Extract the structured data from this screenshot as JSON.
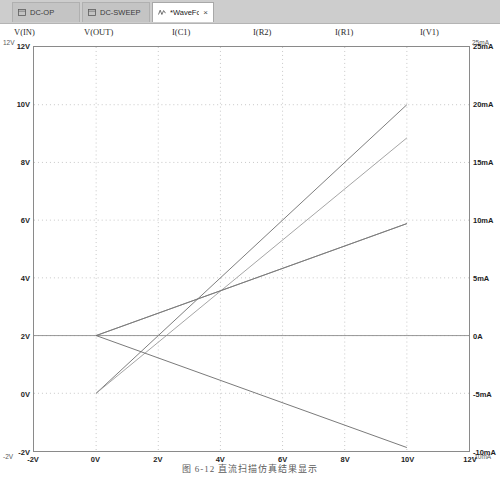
{
  "window": {
    "tabs": [
      {
        "id": "dc-op",
        "label": "DC-OP",
        "icon": "document-icon",
        "active": false,
        "closable": false
      },
      {
        "id": "dc-sweep",
        "label": "DC-SWEEP",
        "icon": "document-icon",
        "active": false,
        "closable": false
      },
      {
        "id": "waveform",
        "label": "*WaveForm",
        "icon": "waveform-icon",
        "active": true,
        "closable": true,
        "close_label": "×"
      }
    ]
  },
  "legend": {
    "items": [
      {
        "label": "V(IN)",
        "x": 14
      },
      {
        "label": "V(OUT)",
        "x": 84
      },
      {
        "label": "I(C1)",
        "x": 172
      },
      {
        "label": "I(R2)",
        "x": 253
      },
      {
        "label": "I(R1)",
        "x": 335
      },
      {
        "label": "I(V1)",
        "x": 420
      }
    ]
  },
  "corner_labels": {
    "top_left": "12V",
    "top_right": "25mA",
    "bottom_left": "-2V",
    "bottom_right": "-10mA"
  },
  "chart_data": {
    "type": "line",
    "title": "",
    "xlabel": "",
    "ylabel": "",
    "grid": true,
    "legend_position": "top",
    "x": [
      -2,
      0,
      2,
      4,
      6,
      8,
      10,
      12
    ],
    "xlim": [
      -2,
      12
    ],
    "xticks": [
      "-2V",
      "0V",
      "2V",
      "4V",
      "6V",
      "8V",
      "10V",
      "12V"
    ],
    "y_left": {
      "label": "V",
      "ylim": [
        -2,
        12
      ],
      "yticks": [
        "-2V",
        "0V",
        "2V",
        "4V",
        "6V",
        "8V",
        "10V",
        "12V"
      ]
    },
    "y_right": {
      "label": "A",
      "ylim": [
        -10,
        25
      ],
      "yticks": [
        "-10mA",
        "-5mA",
        "0A",
        "5mA",
        "10mA",
        "15mA",
        "20mA",
        "25mA"
      ]
    },
    "series": [
      {
        "name": "V(IN)",
        "axis": "left",
        "color": "#6f6f6f",
        "points": [
          [
            0,
            0
          ],
          [
            10,
            10
          ]
        ],
        "note": "ramp 0V to 10V"
      },
      {
        "name": "V(OUT)",
        "axis": "left",
        "color": "#9a9a9a",
        "points": [
          [
            0,
            0
          ],
          [
            10,
            8.85
          ]
        ],
        "note": "ramp 0V to about 8.85V"
      },
      {
        "name": "I(C1)",
        "axis": "right",
        "color": "#8c8c8c",
        "points": [
          [
            -2,
            0
          ],
          [
            12,
            0
          ]
        ],
        "note": "flat 0A across sweep"
      },
      {
        "name": "I(R2)",
        "axis": "right",
        "color": "#7a7a7a",
        "points": [
          [
            0,
            0
          ],
          [
            10,
            9.7
          ]
        ],
        "note": "rises 0mA to about 9.7mA"
      },
      {
        "name": "I(R1)",
        "axis": "right",
        "color": "#7a7a7a",
        "points": [
          [
            0,
            0
          ],
          [
            10,
            9.7
          ]
        ],
        "note": "rises 0mA to about 9.7mA"
      },
      {
        "name": "I(V1)",
        "axis": "right",
        "color": "#6a6a6a",
        "points": [
          [
            0,
            0
          ],
          [
            10,
            -9.7
          ]
        ],
        "note": "falls 0mA to about -9.7mA"
      }
    ]
  },
  "caption": {
    "text": "图 6-12   直流扫描仿真结果显示"
  }
}
